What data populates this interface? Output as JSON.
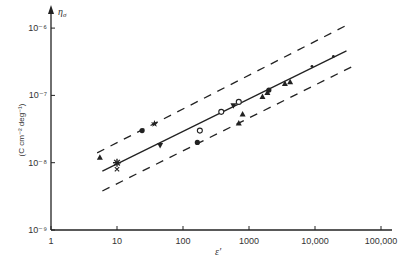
{
  "chart_data": {
    "type": "scatter",
    "title": "",
    "xlabel": "ε′",
    "ylabel": "η_σ  (C cm⁻² deg⁻¹)",
    "xscale": "log",
    "yscale": "log",
    "xlim": [
      1,
      100000
    ],
    "ylim": [
      1e-09,
      1e-06
    ],
    "x_ticks": [
      "1",
      "10",
      "100",
      "1000",
      "10,000",
      "100,000"
    ],
    "y_ticks": [
      "10⁻⁹",
      "10⁻⁸",
      "10⁻⁷",
      "10⁻⁶"
    ],
    "grid": false,
    "legend": null,
    "lines": [
      {
        "name": "fit",
        "style": "solid",
        "x": [
          6,
          30000
        ],
        "y": [
          7.5e-09,
          4.6e-07
        ]
      },
      {
        "name": "upper bound",
        "style": "dashed",
        "x": [
          5,
          30000
        ],
        "y": [
          1.4e-08,
          1.1e-06
        ]
      },
      {
        "name": "lower bound",
        "style": "dashed",
        "x": [
          6,
          40000
        ],
        "y": [
          3.8e-09,
          2.8e-07
        ]
      }
    ],
    "points": [
      {
        "marker": "triangle-up",
        "x": 5.5,
        "y": 1.2e-08
      },
      {
        "marker": "asterisk",
        "x": 10,
        "y": 1e-08
      },
      {
        "marker": "cross",
        "x": 10,
        "y": 8e-09
      },
      {
        "marker": "circle-filled",
        "x": 24,
        "y": 3e-08
      },
      {
        "marker": "star",
        "x": 37,
        "y": 3.8e-08
      },
      {
        "marker": "triangle-down",
        "x": 45,
        "y": 1.8e-08
      },
      {
        "marker": "circle-filled",
        "x": 165,
        "y": 2e-08
      },
      {
        "marker": "circle-open",
        "x": 180,
        "y": 3e-08
      },
      {
        "marker": "circle-open",
        "x": 380,
        "y": 5.7e-08
      },
      {
        "marker": "triangle-down",
        "x": 580,
        "y": 7e-08
      },
      {
        "marker": "circle-open",
        "x": 700,
        "y": 8e-08
      },
      {
        "marker": "triangle-up",
        "x": 800,
        "y": 5.3e-08
      },
      {
        "marker": "triangle-up",
        "x": 700,
        "y": 3.9e-08
      },
      {
        "marker": "triangle-up",
        "x": 1600,
        "y": 9.6e-08
      },
      {
        "marker": "triangle-up",
        "x": 1900,
        "y": 1.1e-07
      },
      {
        "marker": "circle-filled",
        "x": 2000,
        "y": 1.2e-07
      },
      {
        "marker": "triangle-up",
        "x": 3500,
        "y": 1.5e-07
      },
      {
        "marker": "triangle-up",
        "x": 4200,
        "y": 1.6e-07
      },
      {
        "marker": "dot",
        "x": 9000,
        "y": 2.7e-07
      },
      {
        "marker": "dot",
        "x": 19000,
        "y": 3.8e-07
      }
    ]
  },
  "labels": {
    "x_axis_title": "ε′",
    "y_axis_symbol": "η",
    "y_axis_symbol_sub": "σ",
    "y_axis_units": "(C cm⁻² deg⁻¹)"
  }
}
